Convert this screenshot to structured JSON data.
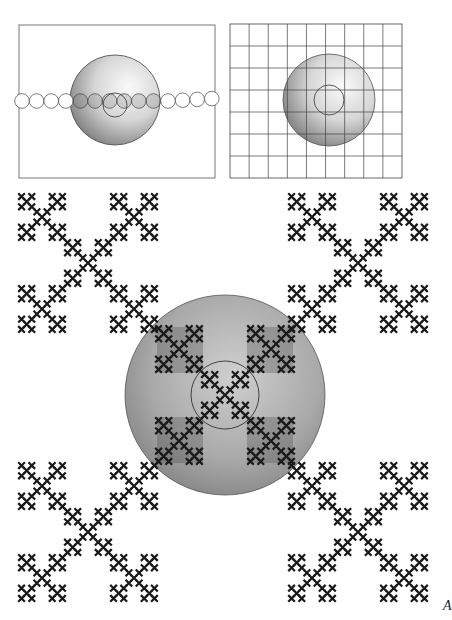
{
  "figure": {
    "panel_a": {
      "description": "Row of circles passing through a shaded disc with a small inner circle",
      "circle_count": 14
    },
    "panel_b": {
      "description": "Grid of squares with a shaded disc and a small inner circle",
      "grid_columns": 9,
      "grid_rows": 7
    },
    "panel_c": {
      "description": "Self-similar X (Vicsek) fractal copies with a shaded disc over the central copy and a small inner circle",
      "fractal_copies": 5,
      "fractal_depth": 3
    },
    "corner_label": "A"
  },
  "colors": {
    "ink": "#1a1a1a",
    "disc_light": "#f4f4f4",
    "disc_dark": "#6e6e6e",
    "frame": "#444444"
  }
}
